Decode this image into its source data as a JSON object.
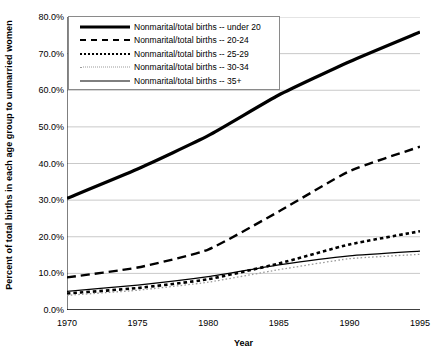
{
  "chart_data": {
    "type": "line",
    "title": "",
    "xlabel": "Year",
    "ylabel": "Percent of total births in each age group to unmarried women",
    "xlim": [
      1970,
      1995
    ],
    "ylim": [
      0,
      80
    ],
    "xticks": [
      "1970",
      "1975",
      "1980",
      "1985",
      "1990",
      "1995"
    ],
    "yticks": [
      "0.0%",
      "10.0%",
      "20.0%",
      "30.0%",
      "40.0%",
      "50.0%",
      "60.0%",
      "70.0%",
      "80.0%"
    ],
    "grid": "horizontal",
    "legend_position": "top-left-inside",
    "x": [
      1970,
      1975,
      1980,
      1985,
      1990,
      1995
    ],
    "series": [
      {
        "name": "Nonmarital/total births -- under 20",
        "style": "solid-thick",
        "color": "#000000",
        "values": [
          30.5,
          38.5,
          47.6,
          58.7,
          67.8,
          75.9
        ]
      },
      {
        "name": "Nonmarital/total births -- 20-24",
        "style": "dash-long",
        "color": "#000000",
        "values": [
          8.9,
          11.6,
          16.5,
          26.9,
          37.9,
          44.6
        ]
      },
      {
        "name": "Nonmarital/total births -- 25-29",
        "style": "dash-short",
        "color": "#000000",
        "values": [
          4.5,
          6.0,
          8.4,
          12.7,
          17.9,
          21.5
        ]
      },
      {
        "name": "Nonmarital/total births -- 30-34",
        "style": "dotted",
        "color": "#9a9a9a",
        "values": [
          4.0,
          5.4,
          7.6,
          11.0,
          14.0,
          15.2
        ]
      },
      {
        "name": "Nonmarital/total births -- 35+",
        "style": "solid-thin",
        "color": "#000000",
        "values": [
          5.1,
          6.8,
          9.1,
          12.3,
          14.8,
          16.1
        ]
      }
    ]
  }
}
